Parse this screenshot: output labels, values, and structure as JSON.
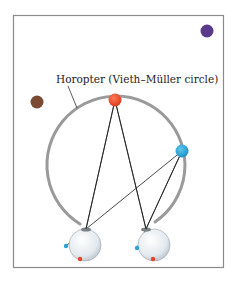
{
  "diagram": {
    "label": "Horopter (Vieth–Müller circle)",
    "colors": {
      "frame": "#8a8a8a",
      "horopter": "#9a9a9a",
      "red_point": "#e8452a",
      "blue_point": "#2aa3d8",
      "purple_point": "#5a3a8a",
      "brown_point": "#7a4a33",
      "lines": "#1a1a1a",
      "eye_fill": "#e9eef2"
    },
    "points": [
      {
        "name": "fixation-point-red",
        "color": "red_point",
        "on_horopter": true
      },
      {
        "name": "point-blue",
        "color": "blue_point",
        "on_horopter": true
      },
      {
        "name": "point-purple",
        "color": "purple_point",
        "on_horopter": false
      },
      {
        "name": "point-brown",
        "color": "brown_point",
        "on_horopter": false
      }
    ],
    "eyes": [
      "left-eye",
      "right-eye"
    ]
  }
}
